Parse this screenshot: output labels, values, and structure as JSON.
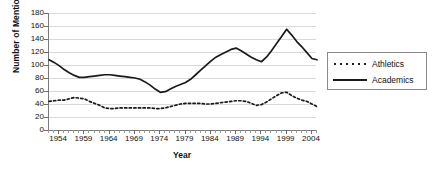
{
  "chart_data": {
    "type": "line",
    "title": "",
    "xlabel": "Year",
    "ylabel": "Number of Mentions",
    "xlim": [
      1952,
      2005
    ],
    "ylim": [
      0,
      180
    ],
    "ytick_step": 20,
    "grid": true,
    "legend_position": "right",
    "yticks": [
      180,
      160,
      140,
      120,
      100,
      80,
      60,
      40,
      20,
      0
    ],
    "xticks": [
      1954,
      1959,
      1964,
      1969,
      1974,
      1979,
      1984,
      1989,
      1994,
      1999,
      2004
    ],
    "x": [
      1952,
      1953,
      1954,
      1955,
      1956,
      1957,
      1958,
      1959,
      1960,
      1961,
      1962,
      1963,
      1964,
      1965,
      1966,
      1967,
      1968,
      1969,
      1970,
      1971,
      1972,
      1973,
      1974,
      1975,
      1976,
      1977,
      1978,
      1979,
      1980,
      1981,
      1982,
      1983,
      1984,
      1985,
      1986,
      1987,
      1988,
      1989,
      1990,
      1991,
      1992,
      1993,
      1994,
      1995,
      1996,
      1997,
      1998,
      1999,
      2000,
      2001,
      2002,
      2003,
      2004,
      2005
    ],
    "series": [
      {
        "name": "Athletics",
        "style": "dotted",
        "color": "#1a1a1a",
        "values": [
          44,
          45,
          46,
          46,
          48,
          50,
          49,
          48,
          44,
          41,
          38,
          34,
          33,
          33,
          34,
          34,
          34,
          34,
          34,
          34,
          34,
          33,
          33,
          34,
          36,
          38,
          40,
          41,
          41,
          41,
          41,
          40,
          40,
          41,
          42,
          43,
          44,
          45,
          45,
          44,
          41,
          38,
          39,
          43,
          48,
          53,
          57,
          58,
          53,
          49,
          46,
          44,
          40,
          36
        ]
      },
      {
        "name": "Academics",
        "style": "solid",
        "color": "#1a1a1a",
        "values": [
          108,
          104,
          99,
          93,
          88,
          84,
          81,
          81,
          82,
          83,
          84,
          85,
          85,
          84,
          83,
          82,
          81,
          80,
          78,
          74,
          69,
          63,
          58,
          59,
          63,
          67,
          70,
          73,
          78,
          85,
          92,
          99,
          106,
          112,
          116,
          120,
          124,
          126,
          122,
          117,
          112,
          108,
          105,
          112,
          122,
          133,
          144,
          155,
          146,
          136,
          128,
          119,
          110,
          108
        ]
      }
    ]
  },
  "legend": {
    "entries": [
      {
        "label": "Athletics",
        "style": "dotted"
      },
      {
        "label": "Academics",
        "style": "solid"
      }
    ]
  }
}
